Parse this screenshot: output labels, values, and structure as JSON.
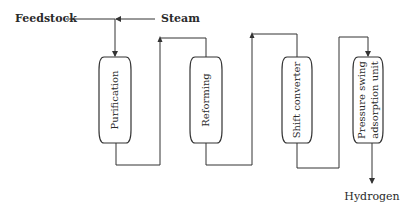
{
  "diagram": {
    "colors": {
      "line": "#333333",
      "text": "#2a2a2a",
      "background": "#ffffff"
    },
    "inputs": [
      {
        "id": "feedstock",
        "label": "Feedstock"
      },
      {
        "id": "steam",
        "label": "Steam"
      }
    ],
    "units": [
      {
        "id": "purification",
        "label_lines": [
          "Purification"
        ]
      },
      {
        "id": "reforming",
        "label_lines": [
          "Reforming"
        ]
      },
      {
        "id": "shift",
        "label_lines": [
          "Shift converter"
        ]
      },
      {
        "id": "psa",
        "label_lines": [
          "Pressure swing",
          "adsorption unit"
        ]
      }
    ],
    "output": {
      "id": "hydrogen",
      "label": "Hydrogen"
    },
    "flow": [
      "Feedstock + Steam",
      "Purification",
      "Reforming",
      "Shift converter",
      "Pressure swing adsorption unit",
      "Hydrogen"
    ]
  }
}
